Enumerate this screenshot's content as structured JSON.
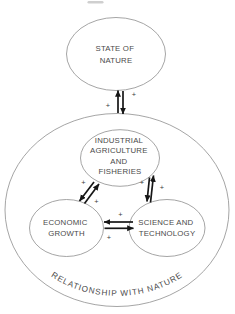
{
  "diagram": {
    "outer_label": "RELATIONSHIP WITH NATURE",
    "nodes": {
      "state_of_nature": {
        "line1": "STATE OF",
        "line2": "NATURE"
      },
      "industrial_agriculture_and_fisheries": {
        "line1": "INDUSTRIAL",
        "line2": "AGRICULTURE",
        "line3": "AND",
        "line4": "FISHERIES"
      },
      "economic_growth": {
        "line1": "ECONOMIC",
        "line2": "GROWTH"
      },
      "science_and_technology": {
        "line1": "SCIENCE AND",
        "line2": "TECHNOLOGY"
      }
    },
    "edges": {
      "nature_relationship": {
        "plus_upper_right": "+",
        "plus_lower_left": "+"
      },
      "industrial_economic": {
        "plus_upper_left": "+",
        "plus_lower_right": "+"
      },
      "industrial_science": {
        "plus_left": "+",
        "plus_right": "+"
      },
      "economic_science": {
        "plus_top": "+",
        "plus_bottom": "+"
      }
    },
    "colors": {
      "background": "#ffffff",
      "ellipse_stroke": "#8e8e8e",
      "text": "#4a4a4a",
      "arrow": "#161616"
    }
  }
}
